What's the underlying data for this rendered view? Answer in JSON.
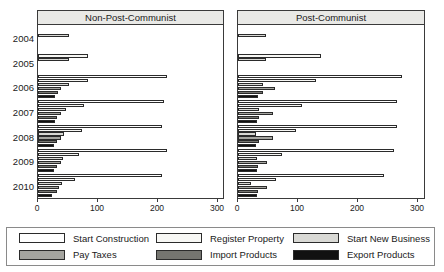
{
  "legend": {
    "items": [
      {
        "label": "Start Construction",
        "color": "#ffffff"
      },
      {
        "label": "Register Property",
        "color": "#f7f7f4"
      },
      {
        "label": "Start New Business",
        "color": "#d9d9d5"
      },
      {
        "label": "Pay Taxes",
        "color": "#a5a5a0"
      },
      {
        "label": "Import Products",
        "color": "#757570"
      },
      {
        "label": "Export Products",
        "color": "#111111"
      }
    ]
  },
  "chart_data": [
    {
      "type": "bar",
      "orientation": "horizontal",
      "title": "Non-Post-Communist",
      "xlabel": "",
      "ylabel": "",
      "xlim": [
        0,
        300
      ],
      "xticks": [
        "0",
        "100",
        "200",
        "300"
      ],
      "categories": [
        "2004",
        "2005",
        "2006",
        "2007",
        "2008",
        "2009",
        "2010"
      ],
      "series": [
        {
          "name": "Start Construction",
          "color": "#ffffff",
          "values": [
            null,
            null,
            215,
            210,
            207,
            215,
            207
          ]
        },
        {
          "name": "Register Property",
          "color": "#f7f7f4",
          "values": [
            null,
            83,
            83,
            77,
            74,
            68,
            61
          ]
        },
        {
          "name": "Start New Business",
          "color": "#d9d9d5",
          "values": [
            52,
            52,
            52,
            47,
            44,
            42,
            40
          ]
        },
        {
          "name": "Pay Taxes",
          "color": "#a5a5a0",
          "values": [
            null,
            null,
            38,
            38,
            38,
            39,
            35
          ]
        },
        {
          "name": "Import Products",
          "color": "#757570",
          "values": [
            null,
            null,
            33,
            32,
            32,
            32,
            31
          ]
        },
        {
          "name": "Export Products",
          "color": "#111111",
          "values": [
            null,
            null,
            29,
            28,
            26,
            26,
            24
          ]
        }
      ]
    },
    {
      "type": "bar",
      "orientation": "horizontal",
      "title": "Post-Communist",
      "xlabel": "",
      "ylabel": "",
      "xlim": [
        0,
        300
      ],
      "xticks": [
        "0",
        "100",
        "200",
        "300"
      ],
      "categories": [
        "2004",
        "2005",
        "2006",
        "2007",
        "2008",
        "2009",
        "2010"
      ],
      "series": [
        {
          "name": "Start Construction",
          "color": "#ffffff",
          "values": [
            null,
            null,
            274,
            265,
            265,
            260,
            243
          ]
        },
        {
          "name": "Register Property",
          "color": "#f7f7f4",
          "values": [
            null,
            138,
            130,
            107,
            96,
            74,
            64
          ]
        },
        {
          "name": "Start New Business",
          "color": "#d9d9d5",
          "values": [
            46,
            46,
            41,
            35,
            30,
            31,
            22
          ]
        },
        {
          "name": "Pay Taxes",
          "color": "#a5a5a0",
          "values": [
            null,
            null,
            61,
            59,
            58,
            49,
            49
          ]
        },
        {
          "name": "Import Products",
          "color": "#757570",
          "values": [
            null,
            null,
            41,
            35,
            35,
            33,
            33
          ]
        },
        {
          "name": "Export Products",
          "color": "#111111",
          "values": [
            null,
            null,
            33,
            31,
            30,
            31,
            31
          ]
        }
      ]
    }
  ]
}
